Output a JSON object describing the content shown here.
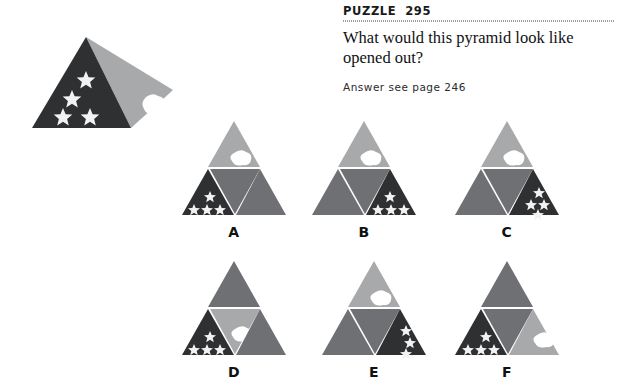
{
  "header": {
    "label": "PUZZLE",
    "number": "295",
    "question": "What would this pyramid look like opened out?",
    "answer_note": "Answer see page 246"
  },
  "colors": {
    "dark": "#2f3032",
    "medium": "#6f7073",
    "light": "#a8a9ab",
    "lighter": "#b9babc",
    "white": "#ffffff",
    "text": "#111111"
  },
  "figure": {
    "name": "pyramid-3d",
    "faces": [
      {
        "name": "front-face",
        "fill": "dark",
        "motif": "four-stars",
        "star_count": 4
      },
      {
        "name": "right-face",
        "fill": "light",
        "motif": "blob",
        "blob_count": 1
      }
    ]
  },
  "options": [
    {
      "label": "A",
      "name": "option-a",
      "faces": {
        "top": {
          "fill": "light",
          "motif": "blob"
        },
        "bottom_left": {
          "fill": "dark",
          "motif": "stars-one-over-three"
        },
        "middle": {
          "fill": "medium",
          "motif": "none"
        },
        "bottom_right": {
          "fill": "medium",
          "motif": "none"
        }
      }
    },
    {
      "label": "B",
      "name": "option-b",
      "faces": {
        "top": {
          "fill": "light",
          "motif": "blob"
        },
        "bottom_left": {
          "fill": "medium",
          "motif": "none"
        },
        "middle": {
          "fill": "medium",
          "motif": "none"
        },
        "bottom_right": {
          "fill": "dark",
          "motif": "stars-one-over-three-right"
        }
      }
    },
    {
      "label": "C",
      "name": "option-c",
      "faces": {
        "top": {
          "fill": "light",
          "motif": "blob"
        },
        "bottom_left": {
          "fill": "medium",
          "motif": "none"
        },
        "middle": {
          "fill": "medium",
          "motif": "none"
        },
        "bottom_right": {
          "fill": "dark",
          "motif": "stars-scattered-diagonal"
        }
      }
    },
    {
      "label": "D",
      "name": "option-d",
      "faces": {
        "top": {
          "fill": "medium",
          "motif": "none"
        },
        "bottom_left": {
          "fill": "dark",
          "motif": "stars-one-over-three"
        },
        "middle": {
          "fill": "light",
          "motif": "blob"
        },
        "bottom_right": {
          "fill": "medium",
          "motif": "none"
        }
      }
    },
    {
      "label": "E",
      "name": "option-e",
      "faces": {
        "top": {
          "fill": "light",
          "motif": "blob"
        },
        "bottom_left": {
          "fill": "medium",
          "motif": "none"
        },
        "middle": {
          "fill": "medium",
          "motif": "none"
        },
        "bottom_right": {
          "fill": "dark",
          "motif": "stars-vertical-column"
        }
      }
    },
    {
      "label": "F",
      "name": "option-f",
      "faces": {
        "top": {
          "fill": "medium",
          "motif": "none"
        },
        "bottom_left": {
          "fill": "dark",
          "motif": "stars-one-over-three"
        },
        "middle": {
          "fill": "medium",
          "motif": "none"
        },
        "bottom_right": {
          "fill": "light",
          "motif": "blob"
        }
      }
    }
  ]
}
